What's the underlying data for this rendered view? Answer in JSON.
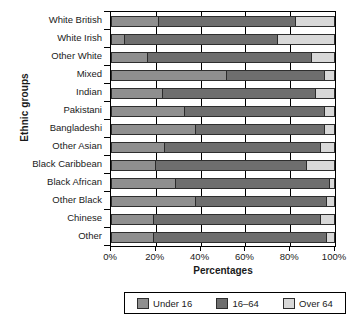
{
  "chart_data": {
    "type": "bar",
    "orientation": "horizontal",
    "stacked": true,
    "title": "",
    "xlabel": "Percentages",
    "ylabel": "Ethnic groups",
    "xlim": [
      0,
      100
    ],
    "xticks": [
      0,
      20,
      40,
      60,
      80,
      100
    ],
    "xticklabels": [
      "0%",
      "20%",
      "40%",
      "60%",
      "80%",
      "100%"
    ],
    "grid": true,
    "legend_position": "bottom",
    "categories": [
      "White British",
      "White Irish",
      "Other White",
      "Mixed",
      "Indian",
      "Pakistani",
      "Bangladeshi",
      "Other Asian",
      "Black Caribbean",
      "Black African",
      "Other Black",
      "Chinese",
      "Other"
    ],
    "series": [
      {
        "name": "Under 16",
        "color": "#8f8f8f",
        "values": [
          21,
          6,
          16,
          52,
          23,
          33,
          38,
          24,
          20,
          29,
          38,
          19,
          19
        ]
      },
      {
        "name": "16–64",
        "color": "#6e6e6e",
        "values": [
          62,
          69,
          74,
          44,
          69,
          63,
          58,
          70,
          68,
          69,
          59,
          75,
          78
        ]
      },
      {
        "name": "Over 64",
        "color": "#d8d8d8",
        "values": [
          17,
          25,
          10,
          4,
          8,
          4,
          4,
          6,
          12,
          2,
          3,
          6,
          3
        ]
      }
    ]
  },
  "legend": {
    "items": [
      {
        "label": "Under 16"
      },
      {
        "label": "16–64"
      },
      {
        "label": "Over 64"
      }
    ]
  }
}
